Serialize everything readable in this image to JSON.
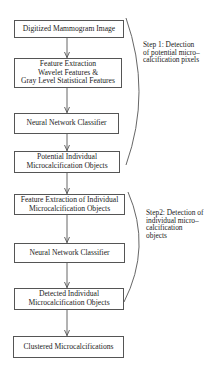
{
  "diagram": {
    "boxes": [
      {
        "id": "digitized-mammogram",
        "lines": [
          "Digitized Mammogram Image"
        ]
      },
      {
        "id": "feature-extraction",
        "lines": [
          "Feature Extraction",
          "Wavelet Features &",
          "Gray Level Statistical Features"
        ]
      },
      {
        "id": "neural-network-1",
        "lines": [
          "Neural Network Classifier"
        ]
      },
      {
        "id": "potential-objects",
        "lines": [
          "Potential Individual",
          "Microcalcification Objects"
        ]
      },
      {
        "id": "feature-extraction-objects",
        "lines": [
          "Feature Extraction of Individual",
          "Microcalcification Objects"
        ]
      },
      {
        "id": "neural-network-2",
        "lines": [
          "Neural Network Classifier"
        ]
      },
      {
        "id": "detected-objects",
        "lines": [
          "Detected Individual",
          "Microcalcification Objects"
        ]
      },
      {
        "id": "clustered",
        "lines": [
          "Clustered Microcalcifications"
        ]
      }
    ],
    "steps": [
      {
        "id": "step1",
        "lines": [
          "Step 1: Detection",
          "of potential micro–",
          "calcification pixels"
        ]
      },
      {
        "id": "step2",
        "lines": [
          "Step2: Detection of",
          "individual micro–",
          "calcification",
          "objects"
        ]
      }
    ],
    "edges": [
      [
        "digitized-mammogram",
        "feature-extraction"
      ],
      [
        "feature-extraction",
        "neural-network-1"
      ],
      [
        "neural-network-1",
        "potential-objects"
      ],
      [
        "potential-objects",
        "feature-extraction-objects"
      ],
      [
        "feature-extraction-objects",
        "neural-network-2"
      ],
      [
        "neural-network-2",
        "detected-objects"
      ],
      [
        "detected-objects",
        "clustered"
      ]
    ],
    "colors": {
      "stroke": "#555555",
      "text": "#222222",
      "background": "#ffffff"
    }
  }
}
